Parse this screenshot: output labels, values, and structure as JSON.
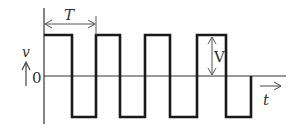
{
  "diagram": {
    "type": "square-wave-voltage-vs-time",
    "labels": {
      "period": "T",
      "amplitude": "V",
      "y_axis": "v",
      "origin": "0",
      "x_axis": "t"
    },
    "colors": {
      "waveform": "#1a1a1a",
      "axis": "#333333",
      "annotation": "#555555",
      "background": "#ffffff"
    },
    "geometry": {
      "zero_y": 76,
      "high_y": 35,
      "low_y": 117,
      "transitions_x": [
        44,
        72,
        96,
        120,
        145,
        170,
        197,
        226,
        251
      ]
    }
  }
}
